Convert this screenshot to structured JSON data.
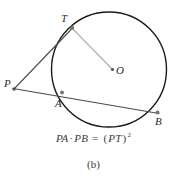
{
  "figure": {
    "caption": "(b)",
    "formula": {
      "left_segment_1": "PA",
      "operator_dot": "·",
      "left_segment_2": "PB",
      "equals": "=",
      "right_open": "(",
      "right_segment": "PT",
      "right_close": ")",
      "exponent": "2",
      "full_text": "PA · PB = (PT)²"
    },
    "labels": {
      "point_p": "P",
      "point_t": "T",
      "point_a": "A",
      "point_b": "B",
      "point_o": "O"
    },
    "colors": {
      "circle_stroke": "#1a1a1a",
      "line_stroke": "#4a4a4a",
      "radius_stroke": "#b5b5b5",
      "point_fill": "#555555",
      "text": "#2b2b2b",
      "background": "#ffffff"
    },
    "geometry": {
      "circle": {
        "cx": 109,
        "cy": 69.5,
        "r": 57.5
      },
      "points": {
        "P": {
          "x": 14,
          "y": 89
        },
        "T": {
          "x": 72,
          "y": 28
        },
        "A": {
          "x": 62,
          "y": 96
        },
        "B": {
          "x": 158,
          "y": 113
        },
        "O": {
          "x": 113,
          "y": 70
        }
      },
      "segments": [
        {
          "name": "tangent-PT",
          "from": "P",
          "to": "T"
        },
        {
          "name": "secant-PB",
          "from": "P",
          "to": "B"
        },
        {
          "name": "radius-TO",
          "from": "T",
          "to": "O"
        }
      ]
    }
  }
}
